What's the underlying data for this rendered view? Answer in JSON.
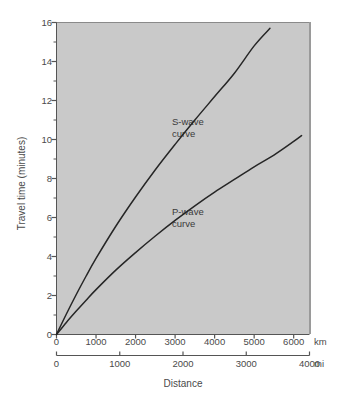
{
  "chart_data": {
    "type": "line",
    "title": "",
    "subtitle": "",
    "xlabel": "Distance",
    "ylabel": "Travel time (minutes)",
    "ylim": [
      0,
      16
    ],
    "grid": false,
    "legend_position": "inline-annotations",
    "background_color": "#c9c9c9",
    "line_color": "#262626",
    "axes": {
      "y": {
        "label": "Travel time (minutes)",
        "unit": "minutes",
        "min": 0,
        "max": 16,
        "major_tick_step": 2,
        "minor_tick_step": 1,
        "tick_labels": [
          "16",
          "14",
          "12",
          "10",
          "8",
          "6",
          "4",
          "2",
          "0"
        ],
        "tick_values": [
          16,
          14,
          12,
          10,
          8,
          6,
          4,
          2,
          0
        ]
      },
      "x_primary": {
        "unit": "km",
        "unit_label": "km",
        "min": 0,
        "max": 6400,
        "tick_labels": [
          "0",
          "1000",
          "2000",
          "3000",
          "4000",
          "5000",
          "6000"
        ],
        "tick_values": [
          0,
          1000,
          2000,
          3000,
          4000,
          5000,
          6000
        ]
      },
      "x_secondary": {
        "unit": "mi",
        "unit_label": "mi",
        "min": 0,
        "max": 4000,
        "tick_labels": [
          "0",
          "1000",
          "2000",
          "3000",
          "4000"
        ],
        "tick_values": [
          0,
          1000,
          2000,
          3000,
          4000
        ]
      }
    },
    "annotations": [
      {
        "name": "s-wave-label",
        "line1": "S-wave",
        "line2": "curve",
        "x_km": 3100,
        "y_min": 11.0
      },
      {
        "name": "p-wave-label",
        "line1": "P-wave",
        "line2": "curve",
        "x_km": 3100,
        "y_min": 6.3
      }
    ],
    "series": [
      {
        "name": "S-wave curve",
        "x_unit": "km",
        "y_unit": "minutes",
        "x": [
          0,
          250,
          500,
          750,
          1000,
          1500,
          2000,
          2500,
          3000,
          3500,
          4000,
          4500,
          5000,
          5400
        ],
        "values": [
          0.0,
          1.05,
          2.05,
          3.0,
          3.9,
          5.55,
          7.05,
          8.45,
          9.75,
          11.0,
          12.2,
          13.4,
          14.8,
          15.7
        ]
      },
      {
        "name": "P-wave curve",
        "x_unit": "km",
        "y_unit": "minutes",
        "x": [
          0,
          250,
          500,
          750,
          1000,
          1500,
          2000,
          2500,
          3000,
          3500,
          4000,
          4500,
          5000,
          5500,
          6000,
          6200
        ],
        "values": [
          0.0,
          0.62,
          1.2,
          1.76,
          2.3,
          3.3,
          4.2,
          5.05,
          5.85,
          6.6,
          7.3,
          7.95,
          8.6,
          9.2,
          9.9,
          10.2
        ]
      }
    ]
  },
  "figure": {
    "x_axis_title": "Distance",
    "y_axis_title": "Travel time (minutes)",
    "km_unit": "km",
    "mi_unit": "mi"
  }
}
